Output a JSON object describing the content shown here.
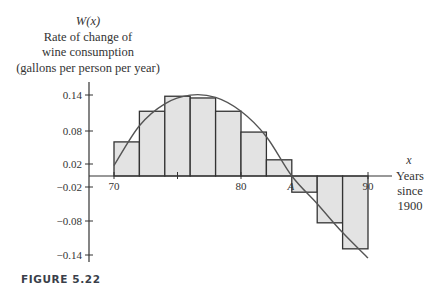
{
  "figure_label": "FIGURE 5.22",
  "y_title": {
    "function": "W(x)",
    "line1": "Rate of change of",
    "line2": "wine consumption",
    "line3": "(gallons per person per year)"
  },
  "x_title": {
    "var": "x",
    "line1": "Years",
    "line2": "since",
    "line3": "1900"
  },
  "point_label": "A",
  "chart_data": {
    "type": "bar",
    "title": "",
    "subtitle": "Rectangles approximating the area under W(x)",
    "xlabel": "x — Years since 1900",
    "ylabel": "W(x) Rate of change of wine consumption (gallons per person per year)",
    "x_ticks": [
      "70",
      "80",
      "A",
      "90"
    ],
    "y_ticks": [
      "0.14",
      "0.08",
      "0.02",
      "-0.02",
      "-0.08",
      "-0.14"
    ],
    "xlim": [
      70,
      90
    ],
    "ylim": [
      -0.14,
      0.14
    ],
    "grid": false,
    "legend": "none",
    "categories": [
      "70-72",
      "72-74",
      "74-76",
      "76-78",
      "78-80",
      "80-82",
      "82-84",
      "84-86",
      "86-88",
      "88-90"
    ],
    "bar_width_years": 2,
    "values": [
      0.059,
      0.112,
      0.138,
      0.135,
      0.112,
      0.076,
      0.028,
      -0.028,
      -0.081,
      -0.126
    ],
    "curve": {
      "name": "W(x)",
      "x": [
        70,
        72,
        74,
        76,
        78,
        80,
        82,
        84,
        86,
        88,
        90
      ],
      "y": [
        0.018,
        0.087,
        0.125,
        0.14,
        0.136,
        0.112,
        0.068,
        0.0,
        -0.048,
        -0.098,
        -0.142
      ]
    },
    "annotations": [
      "A (root of W near x=84)"
    ],
    "fill_color": "#e3e3e3",
    "stroke_color": "#333333",
    "curve_color": "#555555"
  }
}
